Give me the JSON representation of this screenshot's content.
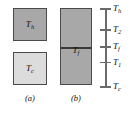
{
  "figure": {
    "panels": [
      {
        "id": "a",
        "caption": "(a)",
        "blocks": [
          {
            "id": "hot",
            "label": "T",
            "subscript": "h",
            "fill": "#a8a8a8",
            "stroke": "#4a4a4a"
          },
          {
            "id": "cold",
            "label": "T",
            "subscript": "c",
            "fill": "#dcdcdc",
            "stroke": "#4a4a4a"
          }
        ]
      },
      {
        "id": "b",
        "caption": "(b)",
        "blocks": [
          {
            "id": "joined",
            "label": "T",
            "subscript": "f",
            "fill": "#a8a8a8",
            "stroke": "#4a4a4a"
          }
        ],
        "interface_line_color": "#3a3a3a"
      }
    ],
    "scale": {
      "axis_color": "#6b6b6b",
      "ticks": [
        {
          "label": "T",
          "subscript": "h",
          "position_pct": 0
        },
        {
          "label": "T",
          "subscript": "2",
          "position_pct": 27
        },
        {
          "label": "T",
          "subscript": "f",
          "position_pct": 49
        },
        {
          "label": "T",
          "subscript": "1",
          "position_pct": 69
        },
        {
          "label": "T",
          "subscript": "c",
          "position_pct": 100
        }
      ]
    }
  }
}
